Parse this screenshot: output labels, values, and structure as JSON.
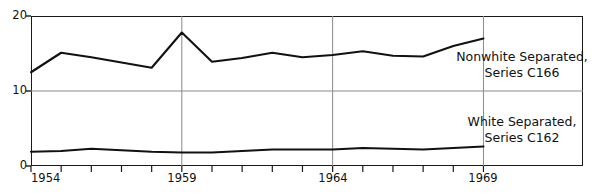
{
  "chart_data": {
    "type": "line",
    "title": "",
    "subtitle": "",
    "xlabel": "",
    "ylabel": "",
    "x": [
      1954,
      1955,
      1956,
      1957,
      1958,
      1959,
      1960,
      1961,
      1962,
      1963,
      1964,
      1965,
      1966,
      1967,
      1968,
      1969
    ],
    "xlim": [
      1954,
      1972.3
    ],
    "ylim": [
      0,
      20
    ],
    "yticks": [
      0,
      10,
      20
    ],
    "ytick_labels": [
      "0",
      "10",
      "20"
    ],
    "xticks": [
      1954,
      1955,
      1956,
      1957,
      1958,
      1959,
      1960,
      1961,
      1962,
      1963,
      1964,
      1965,
      1966,
      1967,
      1968,
      1969
    ],
    "xtick_labels_shown": [
      "1954",
      "1959",
      "1964",
      "1969"
    ],
    "xtick_labels_shown_values": [
      1954,
      1959,
      1964,
      1969
    ],
    "grid": "horizontal gridlines at 10 and 20; vertical gridlines at 1959, 1964, 1969",
    "gridlines_vertical_at": [
      1959,
      1964,
      1969
    ],
    "gridlines_horizontal_at": [
      10,
      20
    ],
    "legend_position": "inline annotations at right of plot",
    "series": [
      {
        "name": "Nonwhite Separated, Series C166",
        "label_line1": "Nonwhite Separated,",
        "label_line2": "Series C166",
        "color": "#111111",
        "values": [
          12.5,
          15.1,
          14.5,
          13.8,
          13.1,
          17.8,
          13.9,
          14.4,
          15.1,
          14.5,
          14.8,
          15.3,
          14.7,
          14.6,
          16.0,
          17.0
        ]
      },
      {
        "name": "White Separated, Series C162",
        "label_line1": "White Separated,",
        "label_line2": "Series C162",
        "color": "#111111",
        "values": [
          1.9,
          2.0,
          2.3,
          2.1,
          1.9,
          1.8,
          1.8,
          2.0,
          2.2,
          2.2,
          2.2,
          2.4,
          2.3,
          2.2,
          2.4,
          2.6
        ]
      }
    ]
  },
  "axes": {
    "y_tick_labels": [
      {
        "value": 20,
        "text": "20"
      },
      {
        "value": 10,
        "text": "10"
      },
      {
        "value": 0,
        "text": "0"
      }
    ],
    "x_tick_labels": [
      {
        "value": 1954,
        "text": "1954"
      },
      {
        "value": 1959,
        "text": "1959"
      },
      {
        "value": 1964,
        "text": "1964"
      },
      {
        "value": 1969,
        "text": "1969"
      }
    ]
  },
  "annotations": {
    "c166": {
      "line1": "Nonwhite Separated,",
      "line2": "Series C166"
    },
    "c162": {
      "line1": "White Separated,",
      "line2": "Series C162"
    }
  },
  "style": {
    "line_color": "#111111",
    "frame_color": "#1a1a1a",
    "grid_color": "#8a8a8a",
    "background": "#ffffff"
  }
}
